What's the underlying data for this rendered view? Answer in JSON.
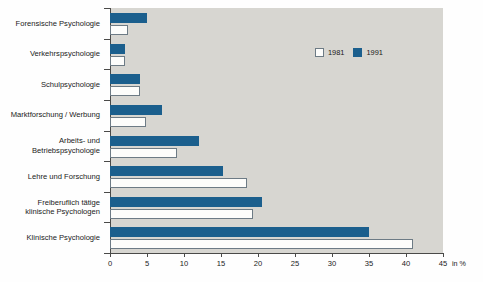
{
  "chart_data": {
    "type": "bar",
    "orientation": "horizontal",
    "title": "",
    "xlabel": "in %",
    "ylabel": "",
    "xlim": [
      0,
      45
    ],
    "xticks": [
      0,
      5,
      10,
      15,
      20,
      25,
      30,
      35,
      40,
      45
    ],
    "xtick_labels": [
      "0",
      "5",
      "10",
      "15",
      "20",
      "25",
      "30",
      "35",
      "40",
      "45"
    ],
    "grid": false,
    "legend_position": "top-right",
    "categories": [
      "Forensische Psychologie",
      "Verkehrspsychologie",
      "Schulpsychologie",
      "Marktforschung / Werbung",
      "Arbeits- und\nBetriebspsychologie",
      "Lehre und Forschung",
      "Freiberuflich tätige\nklinische Psychologen",
      "Klinische Psychologie"
    ],
    "series": [
      {
        "name": "1981",
        "color": "#ffffff",
        "values": [
          2.4,
          2.0,
          4.0,
          4.9,
          9.0,
          18.5,
          19.3,
          41.0
        ]
      },
      {
        "name": "1991",
        "color": "#1b5f8d",
        "values": [
          5.0,
          2.0,
          4.1,
          7.0,
          12.0,
          15.3,
          20.5,
          35.0
        ]
      }
    ]
  },
  "legend": {
    "items": [
      {
        "label": "1981",
        "swatch": "white-square-icon"
      },
      {
        "label": "1991",
        "swatch": "blue-square-icon"
      }
    ]
  },
  "axis": {
    "unit": "in %"
  }
}
